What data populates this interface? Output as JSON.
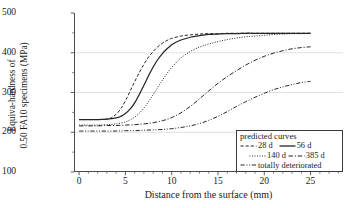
{
  "chart_data": {
    "type": "line",
    "title": "",
    "xlabel": "Distance from the surface (mm)",
    "ylabel_line1": "Equiva-hardness of",
    "ylabel_line2": "0.50 FA10 specimens (MPa)",
    "xlim": [
      -0.55,
      28.5
    ],
    "ylim": [
      100,
      500
    ],
    "xticks": [
      0,
      5,
      10,
      15,
      20,
      25
    ],
    "xticklabels": [
      "0",
      "5",
      "10",
      "15",
      "20",
      "25"
    ],
    "yticks": [
      100,
      200,
      300,
      400,
      500
    ],
    "yticklabels": [
      "100",
      "200",
      "300",
      "400",
      "500"
    ],
    "grid": "horizontal gridlines at 200, 300, 400",
    "gridlines_y": [
      200,
      300,
      400
    ],
    "legend_position": "lower right",
    "legend_title": "predicted curves",
    "series": [
      {
        "name": "28 d",
        "dash": "dashed",
        "x": [
          0,
          1,
          2,
          3,
          3.5,
          4,
          4.5,
          5,
          5.5,
          6,
          6.5,
          7,
          7.5,
          8,
          8.5,
          9,
          9.5,
          10,
          11,
          12,
          13,
          14,
          15,
          16,
          17,
          18,
          19,
          20,
          21,
          22,
          23,
          24,
          25
        ],
        "y": [
          232,
          232,
          232,
          233,
          237,
          245,
          259,
          279,
          303,
          327,
          350,
          371,
          389,
          403,
          415,
          424,
          431,
          436,
          442,
          445,
          447,
          448,
          448,
          449,
          449,
          449,
          449,
          449,
          449,
          449,
          449,
          449,
          449
        ]
      },
      {
        "name": "56 d",
        "dash": "solid",
        "x": [
          0,
          1,
          2,
          3,
          4,
          4.5,
          5,
          5.5,
          6,
          6.5,
          7,
          7.5,
          8,
          8.5,
          9,
          9.5,
          10,
          10.5,
          11,
          12,
          13,
          14,
          15,
          16,
          17,
          18,
          19,
          20,
          21,
          22,
          23,
          24,
          25
        ],
        "y": [
          232,
          232,
          232,
          233,
          236,
          240,
          247,
          258,
          274,
          295,
          318,
          342,
          364,
          383,
          398,
          410,
          420,
          427,
          432,
          439,
          443,
          446,
          447,
          448,
          448,
          449,
          449,
          449,
          449,
          449,
          449,
          449,
          449
        ]
      },
      {
        "name": "140 d",
        "dash": "dotted",
        "x": [
          0,
          1,
          2,
          3,
          4,
          5,
          5.5,
          6,
          6.5,
          7,
          7.5,
          8,
          8.5,
          9,
          9.5,
          10,
          10.5,
          11,
          12,
          13,
          14,
          15,
          16,
          17,
          18,
          19,
          20,
          21,
          22,
          23,
          24,
          25
        ],
        "y": [
          218,
          218,
          218,
          219,
          221,
          226,
          231,
          238,
          248,
          261,
          277,
          295,
          313,
          331,
          348,
          363,
          376,
          387,
          403,
          414,
          422,
          428,
          433,
          437,
          440,
          442,
          444,
          446,
          447,
          448,
          448,
          449
        ]
      },
      {
        "name": "385 d",
        "dash": "dash-dot",
        "x": [
          0,
          1,
          2,
          3,
          4,
          5,
          6,
          7,
          8,
          9,
          10,
          11,
          12,
          13,
          14,
          15,
          16,
          17,
          18,
          19,
          20,
          21,
          22,
          23,
          24,
          25
        ],
        "y": [
          216,
          216,
          216,
          217,
          217,
          218,
          219,
          221,
          224,
          229,
          237,
          249,
          265,
          284,
          304,
          323,
          340,
          355,
          369,
          381,
          391,
          399,
          405,
          410,
          413,
          415
        ]
      },
      {
        "name": "totally deteriorated",
        "dash": "dash-dot-dot",
        "x": [
          0,
          1,
          2,
          3,
          4,
          5,
          6,
          7,
          8,
          9,
          10,
          11,
          12,
          13,
          14,
          15,
          16,
          17,
          18,
          19,
          20,
          21,
          22,
          23,
          24,
          25
        ],
        "y": [
          203,
          203,
          203,
          203,
          203,
          204,
          204,
          205,
          206,
          207,
          209,
          212,
          216,
          222,
          230,
          240,
          252,
          265,
          277,
          288,
          298,
          307,
          314,
          320,
          325,
          328
        ]
      }
    ]
  },
  "legend": {
    "title": "predicted curves",
    "rows": [
      [
        {
          "style": "dashed",
          "label": "28 d"
        },
        {
          "style": "solid",
          "label": "56 d"
        }
      ],
      [
        {
          "style": "dotted",
          "label": "140 d"
        },
        {
          "style": "dash-dot",
          "label": "385 d"
        }
      ],
      [
        {
          "style": "dash-dot-dot",
          "label": "totally deteriorated"
        }
      ]
    ]
  },
  "colors": {
    "axis": "#4a4a4a",
    "grid": "#d8d8d8",
    "curve": "#262626",
    "background": "#ffffff"
  }
}
